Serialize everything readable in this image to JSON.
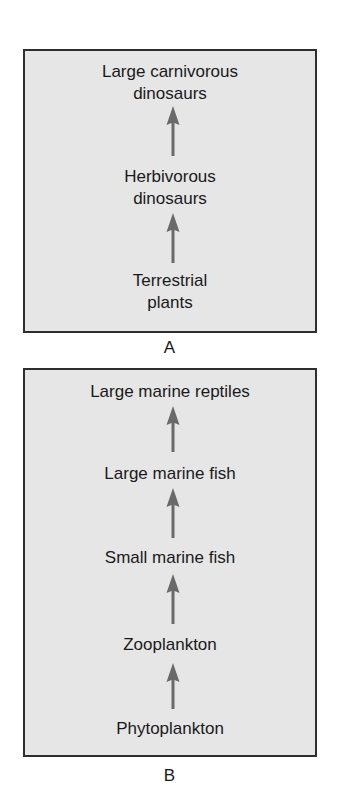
{
  "figure": {
    "panels": [
      {
        "label": "A",
        "chain_direction": "bottom-to-top",
        "nodes": [
          {
            "line1": "Large carnivorous",
            "line2": "dinosaurs"
          },
          {
            "line1": "Herbivorous",
            "line2": "dinosaurs"
          },
          {
            "line1": "Terrestrial",
            "line2": "plants"
          }
        ]
      },
      {
        "label": "B",
        "chain_direction": "bottom-to-top",
        "nodes": [
          {
            "line1": "Large marine reptiles"
          },
          {
            "line1": "Large marine fish"
          },
          {
            "line1": "Small marine fish"
          },
          {
            "line1": "Zooplankton"
          },
          {
            "line1": "Phytoplankton"
          }
        ]
      }
    ],
    "colors": {
      "panel_background": "#e6e6e6",
      "panel_border": "#2e2e2e",
      "arrow": "#6a6a6a",
      "text": "#1a1a1a"
    }
  }
}
